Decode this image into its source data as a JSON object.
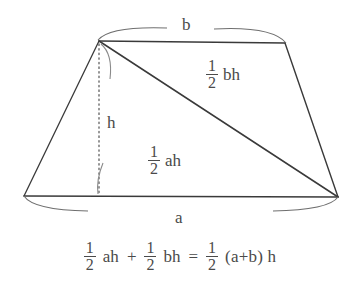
{
  "figure": {
    "type": "geometry-diagram",
    "shape": "trapezoid",
    "colors": {
      "stroke": "#3a3a3a",
      "text": "#4a4a4a",
      "background": "#ffffff",
      "dotted": "#6a6a6a",
      "brace": "#6a6a6a"
    },
    "labels": {
      "top_side": "b",
      "bottom_side": "a",
      "height": "h"
    },
    "areas": {
      "upper_triangle": {
        "numerator": "1",
        "denominator": "2",
        "term": "bh"
      },
      "lower_triangle": {
        "numerator": "1",
        "denominator": "2",
        "term": "ah"
      }
    },
    "vertices": {
      "top_left": [
        99,
        41
      ],
      "top_right": [
        285,
        43
      ],
      "bottom_right": [
        338,
        197
      ],
      "bottom_left": [
        24,
        196
      ],
      "foot_of_height": [
        99,
        196
      ]
    }
  },
  "equation": {
    "first": {
      "numerator": "1",
      "denominator": "2",
      "term": "ah"
    },
    "plus": "+",
    "second": {
      "numerator": "1",
      "denominator": "2",
      "term": "bh"
    },
    "equals": "=",
    "result": {
      "numerator": "1",
      "denominator": "2",
      "term": "(a+b) h"
    },
    "full_text": "1/2 ah + 1/2 bh = 1/2 (a+b) h"
  }
}
